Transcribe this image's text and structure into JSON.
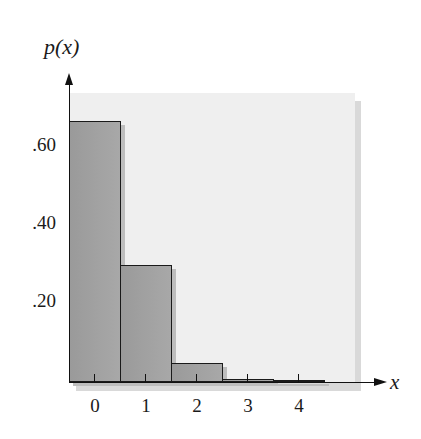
{
  "chart_data": {
    "type": "bar",
    "title": "",
    "xlabel": "x",
    "ylabel": "p(x)",
    "categories": [
      "0",
      "1",
      "2",
      "3",
      "4"
    ],
    "values": [
      0.67,
      0.3,
      0.05,
      0.008,
      0.002
    ],
    "ytick_labels": [
      ".20",
      ".40",
      ".60"
    ],
    "yticks": [
      0.2,
      0.4,
      0.6
    ],
    "ylim": [
      0,
      0.72
    ],
    "grid": false,
    "legend": null,
    "bar_style": "histogram (adjacent bars, no gaps)"
  },
  "labels": {
    "y_axis_title": "p(x)",
    "x_axis_title": "x",
    "y_ticks": [
      ".60",
      ".40",
      ".20"
    ],
    "x_ticks": [
      "0",
      "1",
      "2",
      "3",
      "4"
    ]
  }
}
